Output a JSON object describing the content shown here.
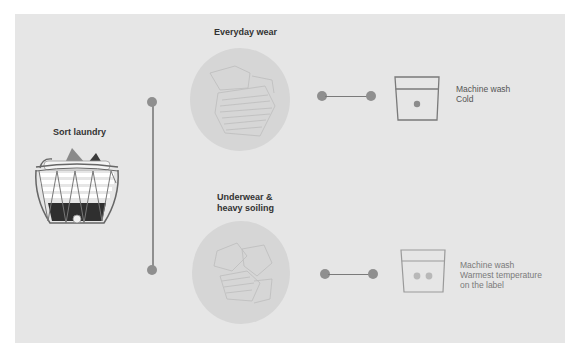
{
  "infographic": {
    "start": {
      "title": "Sort laundry",
      "icon": "laundry-basket-icon"
    },
    "branches": [
      {
        "heading": "Everyday wear",
        "image": "clothes-pile-illustration",
        "care_symbol": "machine-wash-cold-icon",
        "care_dots": 1,
        "instruction_lines": [
          "Machine wash",
          "Cold"
        ]
      },
      {
        "heading_lines": [
          "Underwear &",
          "heavy soiling"
        ],
        "image": "underwear-pile-illustration",
        "care_symbol": "machine-wash-warm-icon",
        "care_dots": 2,
        "instruction_lines": [
          "Machine wash",
          "Warmest temperature",
          "on the label"
        ]
      }
    ],
    "colors": {
      "background": "#e6e6e6",
      "connector": "#8f8f8f",
      "heading_text": "#333333",
      "body_text": "#555555",
      "basket_dark": "#2f2f2f"
    }
  }
}
